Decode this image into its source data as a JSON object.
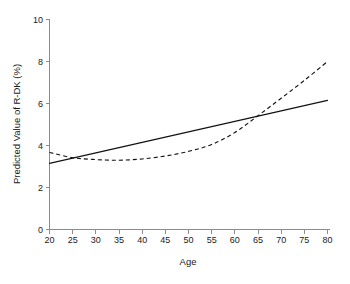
{
  "chart_data": {
    "type": "line",
    "title": "",
    "xlabel": "Age",
    "ylabel": "Predicted Value of R-DK (%)",
    "xlim": [
      20,
      80
    ],
    "ylim": [
      0,
      10
    ],
    "xticks": [
      20,
      25,
      30,
      35,
      40,
      45,
      50,
      55,
      60,
      65,
      70,
      75,
      80
    ],
    "xtick_labels": [
      "20",
      "25",
      "30",
      "35",
      "40",
      "45",
      "50",
      "55",
      "60",
      "65",
      "70",
      "75",
      "80"
    ],
    "yticks": [
      0,
      2,
      4,
      6,
      8,
      10
    ],
    "ytick_labels": [
      "0",
      "2",
      "4",
      "6",
      "8",
      "10"
    ],
    "grid": false,
    "legend": null,
    "legend_position": "none",
    "x": [
      20,
      25,
      30,
      35,
      40,
      45,
      50,
      55,
      60,
      65,
      70,
      75,
      80
    ],
    "series": [
      {
        "name": "Linear fit",
        "style": "solid",
        "color": "#111111",
        "values": [
          3.15,
          3.4,
          3.65,
          3.9,
          4.15,
          4.4,
          4.65,
          4.9,
          5.15,
          5.4,
          5.65,
          5.9,
          6.15
        ]
      },
      {
        "name": "Spline fit",
        "style": "dashed",
        "color": "#111111",
        "values": [
          3.67,
          3.42,
          3.33,
          3.3,
          3.36,
          3.5,
          3.72,
          4.05,
          4.62,
          5.42,
          6.25,
          7.1,
          8.0
        ]
      }
    ]
  },
  "axes": {
    "x_axis_name": "Age",
    "y_axis_name": "Predicted Value of R-DK (%)"
  }
}
